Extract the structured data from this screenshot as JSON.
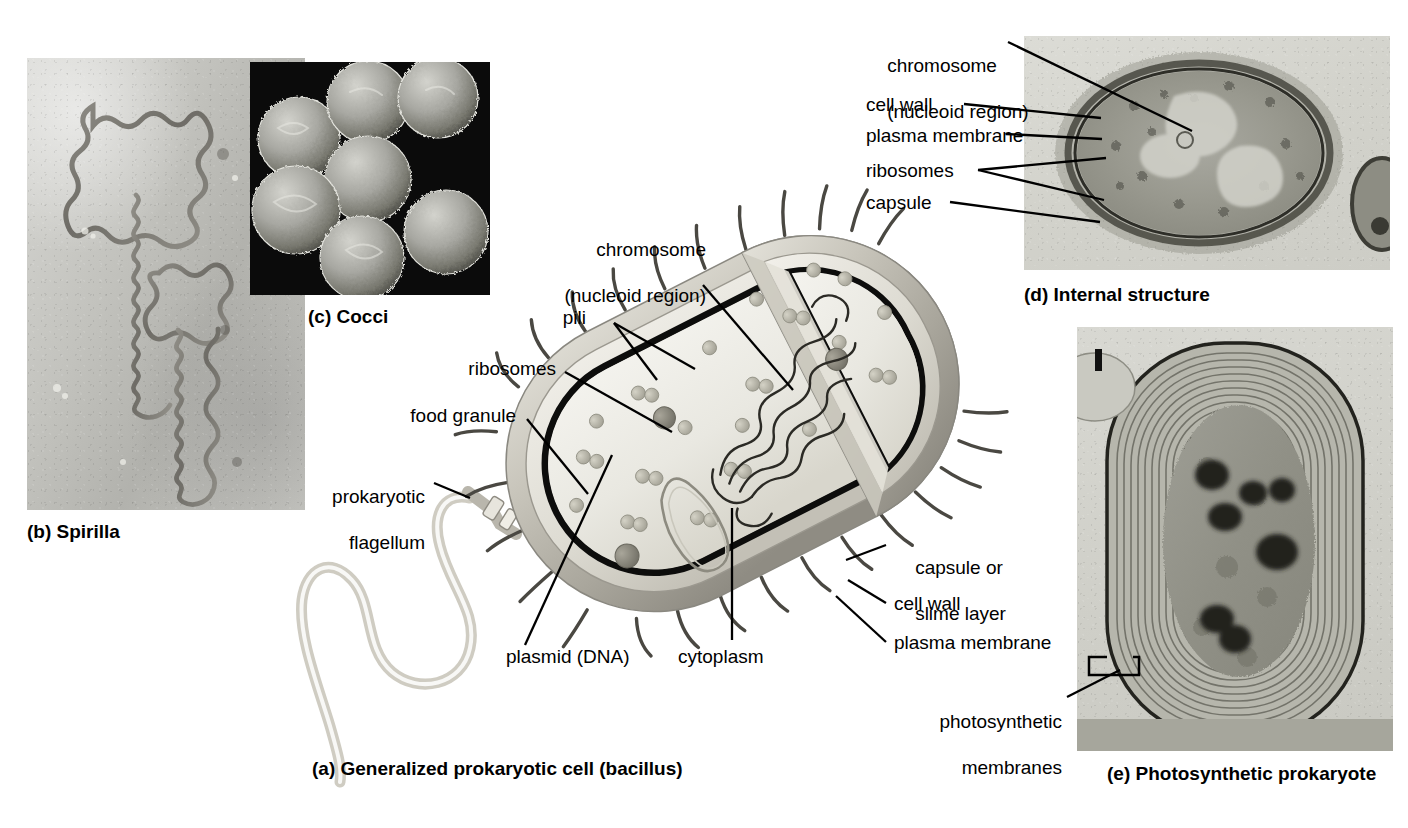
{
  "figure": {
    "background_color": "#ffffff"
  },
  "panels": [
    {
      "id": "a",
      "caption": "(a) Generalized prokaryotic cell (bacillus)",
      "kind": "illustration"
    },
    {
      "id": "b",
      "caption": "(b) Spirilla",
      "kind": "micrograph"
    },
    {
      "id": "c",
      "caption": "(c) Cocci",
      "kind": "micrograph"
    },
    {
      "id": "d",
      "caption": "(d) Internal structure",
      "kind": "micrograph"
    },
    {
      "id": "e",
      "caption": "(e) Photosynthetic prokaryote",
      "kind": "micrograph"
    }
  ],
  "panel_a": {
    "caption": "(a) Generalized prokaryotic cell (bacillus)",
    "labels": {
      "chromosome_line1": "chromosome",
      "chromosome_line2": "(nucleoid region)",
      "pili": "pili",
      "ribosomes": "ribosomes",
      "food_granule": "food granule",
      "flagellum_line1": "prokaryotic",
      "flagellum_line2": "flagellum",
      "plasmid": "plasmid (DNA)",
      "cytoplasm": "cytoplasm",
      "capsule_line1": "capsule or",
      "capsule_line2": "slime layer",
      "cell_wall": "cell wall",
      "plasma_membrane": "plasma membrane"
    }
  },
  "panel_b": {
    "caption": "(b) Spirilla"
  },
  "panel_c": {
    "caption": "(c) Cocci"
  },
  "panel_d": {
    "caption": "(d) Internal structure",
    "labels": {
      "chromosome_line1": "chromosome",
      "chromosome_line2": "(nucleoid region)",
      "cell_wall": "cell wall",
      "plasma_membrane": "plasma membrane",
      "ribosomes": "ribosomes",
      "capsule": "capsule"
    }
  },
  "panel_e": {
    "caption": "(e) Photosynthetic prokaryote",
    "labels": {
      "photosynthetic_line1": "photosynthetic",
      "photosynthetic_line2": "membranes"
    }
  },
  "colors": {
    "text": "#000000",
    "leader_line": "#000000",
    "capsule_outer": "#b9b6ad",
    "cell_wall": "#d3d0c6",
    "plasma_membrane": "#111111",
    "cytoplasm": "#e8e7df",
    "ribosome": "#b4b2a6",
    "nucleoid": "#555249",
    "flagellum": "#cfccc2",
    "micrograph_black": "#0b0b0b"
  }
}
